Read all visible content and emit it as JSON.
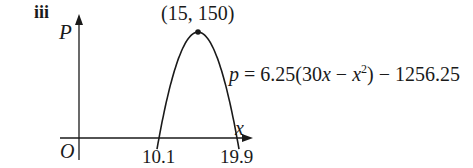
{
  "part_label": "iii",
  "chart_data": {
    "type": "line",
    "title": "",
    "xlabel": "x",
    "ylabel": "P",
    "origin_label": "O",
    "equation": "p = 6.25(30x − x²) − 1256.25",
    "equation_parts": {
      "lhs": "p",
      "mid1": " = 6.25(30",
      "x1": "x",
      "mid2": " − ",
      "x2": "x",
      "sup": "2",
      "rhs": ") − 1256.25"
    },
    "vertex": {
      "x": 15,
      "y": 150,
      "label": "(15, 150)"
    },
    "roots": [
      10.1,
      19.9
    ],
    "x_tick_labels": [
      "10.1",
      "19.9"
    ],
    "x": [
      10.1,
      11,
      12,
      13,
      14,
      15,
      16,
      17,
      18,
      19,
      19.9
    ],
    "y": [
      0,
      43.75,
      93.75,
      125,
      143.75,
      150,
      143.75,
      125,
      93.75,
      43.75,
      0
    ],
    "grid": false,
    "legend": "none"
  }
}
